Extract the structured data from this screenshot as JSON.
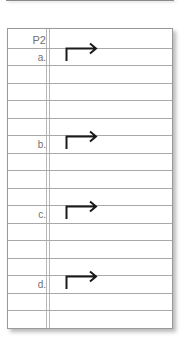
{
  "worksheet": {
    "header_label": "P2",
    "rows": [
      {
        "label": "a.",
        "arrow": "right-angle-arrow"
      },
      {
        "label": "b.",
        "arrow": "right-angle-arrow"
      },
      {
        "label": "c.",
        "arrow": "right-angle-arrow"
      },
      {
        "label": "d.",
        "arrow": "right-angle-arrow"
      }
    ]
  },
  "colors": {
    "line": "#a9a9a9",
    "arrow": "#1a1a1a",
    "label": "#6f6f6f"
  }
}
